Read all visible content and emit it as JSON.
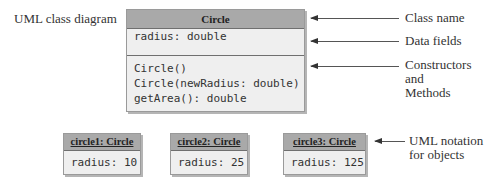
{
  "diagram_label": "UML class diagram",
  "class": {
    "name": "Circle",
    "data_fields": [
      "radius: double"
    ],
    "methods": [
      "Circle()",
      "Circle(newRadius: double)",
      "getArea(): double"
    ]
  },
  "annotations": {
    "class_name": "Class name",
    "data_fields": "Data fields",
    "constructors_methods_line1": "Constructors and",
    "constructors_methods_line2": "Methods",
    "objects_line1": "UML notation",
    "objects_line2": "for objects"
  },
  "objects": [
    {
      "header": "circle1: Circle",
      "field": "radius: 10"
    },
    {
      "header": "circle2: Circle",
      "field": "radius: 25"
    },
    {
      "header": "circle3: Circle",
      "field": "radius: 125"
    }
  ],
  "colors": {
    "header_fill": "#a9a9a9",
    "body_fill": "#efefef",
    "border": "#6f6f6f",
    "text": "#333333"
  }
}
